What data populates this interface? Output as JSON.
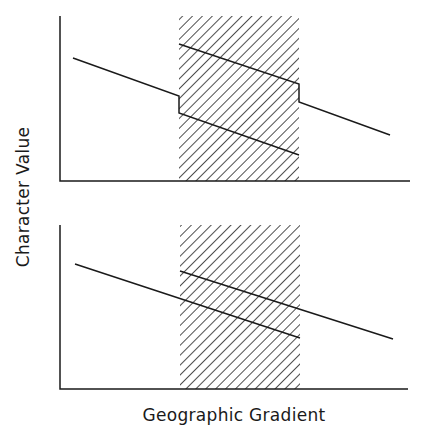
{
  "figure": {
    "ylabel": "Character Value",
    "xlabel": "Geographic Gradient",
    "line_color": "#1a1a1a",
    "hatch_color": "#222222"
  },
  "panels": [
    {
      "name": "top-panel",
      "axes": {
        "x0": 60,
        "y_top": 16,
        "y_base": 181,
        "x_end": 410
      },
      "hatched_zone": {
        "x": 179,
        "y": 16,
        "w": 120,
        "h": 165
      },
      "path": "M73,58 L179,96 L179,113 L299,155 M179,44 L299,84 L299,102 L390,135"
    },
    {
      "name": "bottom-panel",
      "axes": {
        "x0": 60,
        "y_top": 225,
        "y_base": 389,
        "x_end": 408
      },
      "hatched_zone": {
        "x": 180,
        "y": 225,
        "w": 120,
        "h": 164
      },
      "path": "M75,264 L300,338 M180,271 L393,339"
    }
  ]
}
